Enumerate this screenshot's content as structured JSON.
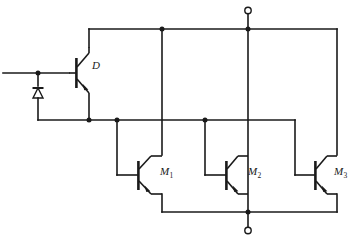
{
  "figure": {
    "background_color": "#ffffff",
    "line_color": "#1a1a1a",
    "width": 354,
    "height": 240
  },
  "labels": {
    "driver": "D",
    "m1_main": "M",
    "m1_sub": "1",
    "m2_main": "M",
    "m2_sub": "2",
    "m3_main": "M",
    "m3_sub": "3"
  },
  "components": [
    {
      "id": "D",
      "name": "driver-transistor",
      "type": "npn-bjt",
      "label": "D",
      "label_x": 92,
      "label_y": 66
    },
    {
      "id": "M1",
      "name": "output-transistor-m1",
      "type": "npn-bjt",
      "label": "M1",
      "label_x": 160,
      "label_y": 172
    },
    {
      "id": "M2",
      "name": "output-transistor-m2",
      "type": "npn-bjt",
      "label": "M2",
      "label_x": 248,
      "label_y": 172
    },
    {
      "id": "M3",
      "name": "output-transistor-m3",
      "type": "npn-bjt",
      "label": "M3",
      "label_x": 334,
      "label_y": 172
    },
    {
      "id": "D1",
      "name": "protection-diode",
      "type": "diode",
      "label": ""
    }
  ],
  "terminals": [
    {
      "id": "T_top",
      "name": "top-supply-terminal",
      "x": 248,
      "y": 10,
      "radius": 3.2
    },
    {
      "id": "T_bottom",
      "name": "bottom-return-terminal",
      "x": 248,
      "y": 231,
      "radius": 3.2
    },
    {
      "id": "T_input",
      "name": "input-lead-left",
      "x": 3,
      "y": 73
    }
  ],
  "nodes": [
    {
      "id": "N_in",
      "name": "input-junction",
      "x": 38,
      "y": 73
    },
    {
      "id": "N_top_m1",
      "name": "top-rail-junction-m1",
      "x": 162,
      "y": 29
    },
    {
      "id": "N_top_term",
      "name": "top-rail-terminal-junction",
      "x": 248,
      "y": 29
    },
    {
      "id": "N_d_emit",
      "name": "driver-emitter-junction",
      "x": 89,
      "y": 120
    },
    {
      "id": "N_m1_base",
      "name": "m1-base-junction",
      "x": 117,
      "y": 120
    },
    {
      "id": "N_m2_base",
      "name": "m2-base-junction",
      "x": 205,
      "y": 120
    },
    {
      "id": "N_bot_term",
      "name": "bottom-rail-terminal-junction",
      "x": 248,
      "y": 212
    }
  ],
  "rails": {
    "top_rail_y": 29,
    "mid_rail_y": 120,
    "bottom_rail_y": 212,
    "top_rail_x_start": 89,
    "top_rail_x_end": 337,
    "mid_rail_x_start": 38,
    "mid_rail_x_end": 295,
    "bottom_rail_x_start": 162,
    "bottom_rail_x_end": 337
  }
}
